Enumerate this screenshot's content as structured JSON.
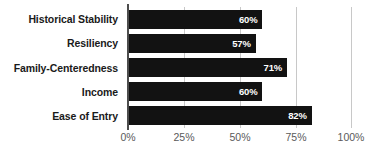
{
  "chart_data": {
    "type": "bar",
    "orientation": "horizontal",
    "title": "",
    "xlabel": "",
    "ylabel": "",
    "categories": [
      "Historical Stability",
      "Resiliency",
      "Family-Centeredness",
      "Income",
      "Ease of Entry"
    ],
    "values": [
      60,
      57,
      71,
      60,
      82
    ],
    "value_labels": [
      "60%",
      "57%",
      "71%",
      "60%",
      "82%"
    ],
    "xlim": [
      0,
      100
    ],
    "xticks": [
      0,
      25,
      50,
      75,
      100
    ],
    "xtick_labels": [
      "0%",
      "25%",
      "50%",
      "75%",
      "100%"
    ],
    "grid": true,
    "grid_axis": "x",
    "legend": false,
    "bar_color": "#121212",
    "value_label_color": "#ffffff",
    "gridline_color": "#c8c8c8",
    "axis_line_color": "#4d4d4d",
    "tick_label_color": "#5a5a5a",
    "category_label_color": "#1a1a1a",
    "background_color": "#ffffff"
  }
}
